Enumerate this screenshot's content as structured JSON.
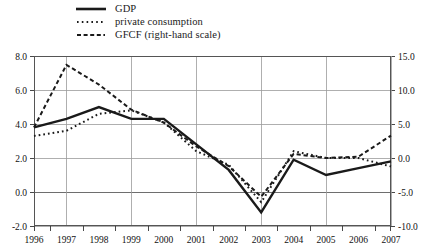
{
  "chart_data": {
    "type": "line",
    "title": "",
    "subtitle": "",
    "xlabel": "",
    "ylabel": "",
    "grid": true,
    "legend_position": "top-left",
    "categories": [
      "1996",
      "1997",
      "1998",
      "1999",
      "2000",
      "2001",
      "2002",
      "2003",
      "2004",
      "2005",
      "2006",
      "2007"
    ],
    "x": [
      1996,
      1997,
      1998,
      1999,
      2000,
      2001,
      2002,
      2003,
      2004,
      2005,
      2006,
      2007
    ],
    "axes": {
      "left": {
        "ticks": [
          "8.0",
          "6.0",
          "4.0",
          "2.0",
          "0.0",
          "-2.0"
        ],
        "tick_values": [
          8.0,
          6.0,
          4.0,
          2.0,
          0.0,
          -2.0
        ],
        "ylim": [
          -2.0,
          8.0
        ],
        "applies_to": [
          "GDP",
          "private consumption"
        ]
      },
      "right": {
        "ticks": [
          "15.0",
          "10.0",
          "5.0",
          "0.0",
          "-5.0",
          "-10.0"
        ],
        "tick_values": [
          15.0,
          10.0,
          5.0,
          0.0,
          -5.0,
          -10.0
        ],
        "ylim": [
          -10.0,
          15.0
        ],
        "applies_to": [
          "GFCF (right-hand scale)"
        ]
      },
      "x": {
        "ticks": [
          "1996",
          "1997",
          "1998",
          "1999",
          "2000",
          "2001",
          "2002",
          "2003",
          "2004",
          "2005",
          "2006",
          "2007"
        ],
        "xlim": [
          1996,
          2007
        ]
      }
    },
    "series": [
      {
        "name": "GDP",
        "axis": "left",
        "style": "solid",
        "color": "#1a1a1a",
        "width": 2.4,
        "values": [
          3.8,
          4.3,
          5.0,
          4.3,
          4.3,
          2.8,
          1.3,
          -1.2,
          1.9,
          1.0,
          1.4,
          1.8
        ]
      },
      {
        "name": "private consumption",
        "axis": "left",
        "style": "dotted",
        "color": "#1a1a1a",
        "width": 2.0,
        "values": [
          3.3,
          3.6,
          4.6,
          4.8,
          4.1,
          2.4,
          1.6,
          -0.6,
          2.4,
          2.0,
          2.0,
          1.5
        ]
      },
      {
        "name": "GFCF (right-hand scale)",
        "axis": "right",
        "style": "dashed",
        "color": "#1a1a1a",
        "width": 2.0,
        "values": [
          4.5,
          13.7,
          10.8,
          7.1,
          5.2,
          1.7,
          -1.2,
          -5.7,
          0.6,
          0.0,
          0.2,
          3.3
        ]
      }
    ]
  },
  "legend": {
    "items": [
      {
        "label": "GDP",
        "style": "solid"
      },
      {
        "label": "private consumption",
        "style": "dotted"
      },
      {
        "label": "GFCF (right-hand scale)",
        "style": "dashed"
      }
    ]
  }
}
